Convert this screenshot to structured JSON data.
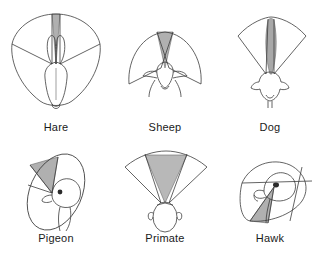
{
  "figure": {
    "type": "scientific-illustration-grid",
    "title": "",
    "rows": 2,
    "columns": 3,
    "background_color": "#ffffff",
    "line_color": "#3c3c3c",
    "binocular_field_fill": "#b3b3b3",
    "monocular_field_fill": "#ffffff",
    "caption_color": "#1a1a1a"
  },
  "panels": [
    {
      "id": "hare",
      "label": "Hare",
      "animal": "Hare",
      "eye_placement": "lateral",
      "total_field_description": "near-panoramic, almost 360 degrees",
      "binocular_field_description": "very narrow binocular wedge directly in front",
      "binocular_overlap_degrees": 10,
      "total_visual_field_degrees": 355,
      "head_view": "dorsal",
      "binocular_wedge_width_px": 9,
      "field_shape": "broad-rounded-shield"
    },
    {
      "id": "sheep",
      "label": "Sheep",
      "animal": "Sheep",
      "eye_placement": "lateral",
      "total_field_description": "wide semicircular field",
      "binocular_field_description": "narrow binocular wedge in front",
      "binocular_overlap_degrees": 25,
      "total_visual_field_degrees": 300,
      "head_view": "dorsal",
      "binocular_wedge_width_px": 18,
      "field_shape": "wide-semicircle"
    },
    {
      "id": "dog",
      "label": "Dog",
      "animal": "Dog",
      "eye_placement": "semi-frontal",
      "total_field_description": "broad forward fan",
      "binocular_field_description": "tall narrow binocular spindle in front",
      "binocular_overlap_degrees": 60,
      "total_visual_field_degrees": 250,
      "head_view": "dorsal",
      "binocular_wedge_width_px": 20,
      "field_shape": "forward-fan"
    },
    {
      "id": "pigeon",
      "label": "Pigeon",
      "animal": "Pigeon",
      "eye_placement": "lateral",
      "total_field_description": "tilted panoramic ellipse",
      "binocular_field_description": "small binocular wedge above the bill",
      "binocular_overlap_degrees": 25,
      "total_visual_field_degrees": 340,
      "head_view": "oblique",
      "binocular_wedge_width_px": 30,
      "field_shape": "tilted-ellipse"
    },
    {
      "id": "primate",
      "label": "Primate",
      "animal": "Primate",
      "eye_placement": "frontal",
      "total_field_description": "forward fan",
      "binocular_field_description": "wide binocular wedge occupying most of the field",
      "binocular_overlap_degrees": 120,
      "total_visual_field_degrees": 190,
      "head_view": "dorsal",
      "binocular_wedge_width_px": 55,
      "field_shape": "forward-fan"
    },
    {
      "id": "hawk",
      "label": "Hawk",
      "animal": "Hawk",
      "eye_placement": "semi-frontal",
      "total_field_description": "tilted oblique field",
      "binocular_field_description": "binocular wedge projecting forward below the bill",
      "binocular_overlap_degrees": 35,
      "total_visual_field_degrees": 290,
      "head_view": "oblique",
      "binocular_wedge_width_px": 28,
      "field_shape": "tilted-oblique"
    }
  ]
}
